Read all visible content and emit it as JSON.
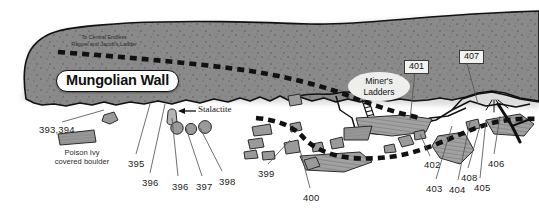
{
  "figure": {
    "kind": "cliff-profile-survey-map",
    "background": "#ffffff",
    "rock_fill": "#8a8a8a",
    "rock_stroke": "#111111",
    "boulder_fill": "#9a9a9a",
    "route_color": "#111111"
  },
  "annotations": {
    "route_note": "To Central Endless\nRappel and Jacob's Ladder",
    "route_note_line1": "To Central Endless",
    "route_note_line2": "Rappel and Jacob's Ladder",
    "wall_name": "Mungolian Wall",
    "miners_ladders_line1": "Miner's",
    "miners_ladders_line2": "Ladders",
    "stalactite": "Stalactite",
    "poison_ivy_line1": "Poison Ivy",
    "poison_ivy_line2": "covered boulder"
  },
  "boxed_numbers": [
    {
      "label": "401",
      "x": 404,
      "y": 60
    },
    {
      "label": "407",
      "x": 459,
      "y": 50
    }
  ],
  "route_numbers": [
    {
      "label": "393,394",
      "x": 39,
      "y": 124
    },
    {
      "label": "395",
      "x": 128,
      "y": 158
    },
    {
      "label": "396",
      "x": 142,
      "y": 177
    },
    {
      "label": "396",
      "x": 172,
      "y": 181
    },
    {
      "label": "397",
      "x": 196,
      "y": 181
    },
    {
      "label": "398",
      "x": 219,
      "y": 176
    },
    {
      "label": "399",
      "x": 258,
      "y": 168
    },
    {
      "label": "400",
      "x": 303,
      "y": 192
    },
    {
      "label": "402",
      "x": 424,
      "y": 159
    },
    {
      "label": "403",
      "x": 426,
      "y": 183
    },
    {
      "label": "404",
      "x": 449,
      "y": 184
    },
    {
      "label": "405",
      "x": 474,
      "y": 182
    },
    {
      "label": "406",
      "x": 488,
      "y": 158
    },
    {
      "label": "408",
      "x": 461,
      "y": 172
    }
  ]
}
